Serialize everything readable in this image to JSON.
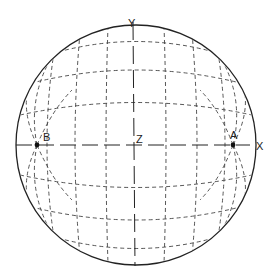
{
  "diagram": {
    "type": "sphere-projection",
    "colors": {
      "line": "#333333",
      "background": "#ffffff"
    },
    "sphere": {
      "cx": 136,
      "cy": 145,
      "r": 120
    },
    "labels": {
      "x_axis": "X",
      "y_axis": "Y",
      "z_axis": "Z",
      "point_a": "A",
      "point_b": "B"
    },
    "points": [
      {
        "name": "A",
        "x": 233,
        "y": 145
      },
      {
        "name": "B",
        "x": 37,
        "y": 145
      }
    ]
  }
}
